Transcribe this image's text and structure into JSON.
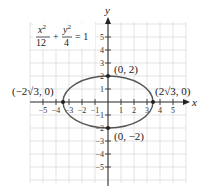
{
  "chart_data": {
    "type": "line",
    "title": "",
    "equation": {
      "x_num": "x²",
      "x_den": "12",
      "plus": "+",
      "y_num": "y²",
      "y_den": "4",
      "rhs": "= 1"
    },
    "xlabel": "x",
    "ylabel": "y",
    "xlim": [
      -6,
      6
    ],
    "ylim": [
      -6,
      6
    ],
    "grid": true,
    "x_ticks": [
      -5,
      -4,
      -3,
      -2,
      -1,
      1,
      2,
      3,
      4,
      5
    ],
    "y_ticks": [
      -5,
      -4,
      -3,
      -2,
      -1,
      1,
      2,
      3,
      4,
      5
    ],
    "series": [
      {
        "name": "ellipse x^2/12 + y^2/4 = 1",
        "shape": "ellipse",
        "center": [
          0,
          0
        ],
        "semi_major_x": 3.4641,
        "semi_minor_y": 2,
        "color": "#555555"
      }
    ],
    "points": [
      {
        "x": 0,
        "y": 2,
        "label": "(0, 2)"
      },
      {
        "x": 0,
        "y": -2,
        "label": "(0, −2)"
      },
      {
        "x": -3.4641,
        "y": 0,
        "label": "(−2√3, 0)"
      },
      {
        "x": 3.4641,
        "y": 0,
        "label": "(2√3, 0)"
      }
    ]
  },
  "labels": {
    "x_axis": "x",
    "y_axis": "y",
    "pt_top": "(0, 2)",
    "pt_bottom": "(0, −2)",
    "pt_left": "(−2√3, 0)",
    "pt_right": "(2√3, 0)",
    "eq_x_num": "x",
    "eq_x_den": "12",
    "eq_plus": "+",
    "eq_y_num": "y",
    "eq_y_den": "4",
    "eq_rhs": "= 1",
    "sup2": "2"
  },
  "ticks": {
    "x": [
      "−5",
      "−4",
      "−3",
      "−2",
      "−1",
      "1",
      "2",
      "3",
      "4",
      "5"
    ],
    "y": [
      "5",
      "4",
      "3",
      "2",
      "1",
      "−1",
      "−2",
      "−3",
      "−4",
      "−5"
    ]
  }
}
